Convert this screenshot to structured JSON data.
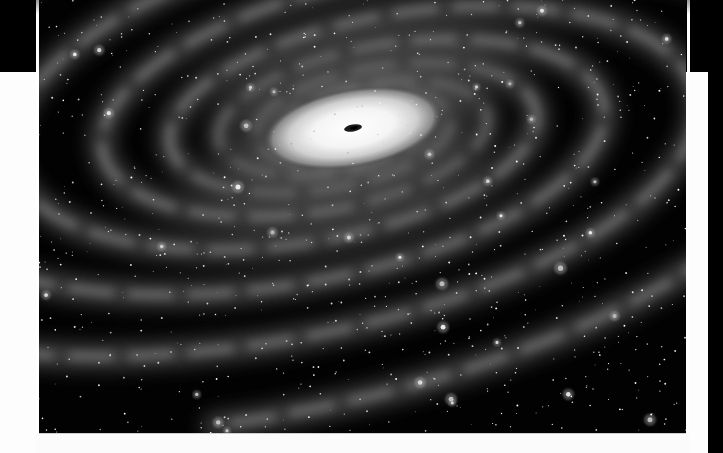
{
  "image": {
    "subject": "spiral galaxy illustration",
    "palette": {
      "space": "#020202",
      "core": "#ffffff",
      "arms": "#7a7a7a",
      "frame": "#fdfdfd",
      "band": "#000000"
    },
    "core": {
      "cx": 314,
      "cy": 128,
      "rx": 92,
      "ry": 40,
      "tilt_deg": -10
    },
    "star_count": 900,
    "seed": 7
  },
  "layout": {
    "top_band_height": 72,
    "left_panel_width": 36,
    "right_panel_x": 689,
    "right_strip_x": 708,
    "bottom_strip_y": 433
  }
}
